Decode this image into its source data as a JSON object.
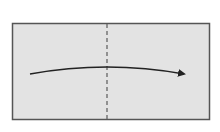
{
  "diagram": {
    "type": "origami-fold-instruction",
    "paper": {
      "x": 12,
      "y": 23,
      "width": 198,
      "height": 97,
      "fill": "#e3e3e3",
      "stroke": "#555555"
    },
    "fold_line": {
      "style": "dashed",
      "kind": "valley-fold",
      "x": 107,
      "y1": 23,
      "y2": 120,
      "color": "#666666"
    },
    "arrow": {
      "direction": "left-to-right",
      "path": "M30,74 Q107,60 184,74",
      "color": "#222222"
    }
  }
}
